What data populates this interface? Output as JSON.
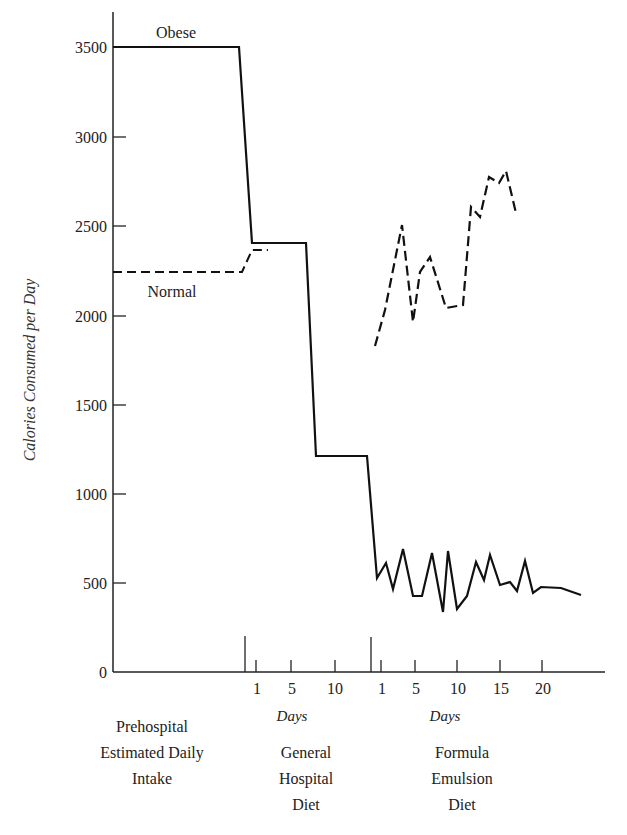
{
  "chart_data": {
    "type": "line",
    "title": "",
    "ylabel": "Calories Consumed per Day",
    "xlabel": "",
    "ylim": [
      0,
      3700
    ],
    "yticks": [
      0,
      500,
      1000,
      1500,
      2000,
      2500,
      3000,
      3500
    ],
    "grid": false,
    "phases": [
      {
        "name": "prehospital",
        "label_lines": [
          "Prehospital",
          "Estimated Daily",
          "Intake"
        ],
        "x_label": ""
      },
      {
        "name": "general-hospital",
        "label_lines": [
          "General",
          "Hospital",
          "Diet"
        ],
        "x_label": "Days",
        "day_ticks": [
          1,
          5,
          10
        ]
      },
      {
        "name": "formula-emulsion",
        "label_lines": [
          "Formula",
          "Emulsion",
          "Diet"
        ],
        "x_label": "Days",
        "day_ticks": [
          1,
          5,
          10,
          15,
          20
        ]
      }
    ],
    "series": [
      {
        "name": "Obese",
        "style": "solid",
        "segments": {
          "prehospital": 3500,
          "general_hospital": [
            {
              "days": "1-6",
              "value": 2400
            },
            {
              "days": "7-13",
              "value": 1200
            }
          ],
          "formula_emulsion": {
            "days": [
              0,
              1,
              2,
              3,
              4,
              5,
              6,
              7,
              8,
              9,
              10,
              11,
              12,
              13,
              14,
              15,
              16,
              17,
              18,
              19,
              20,
              22,
              24
            ],
            "values": [
              530,
              615,
              465,
              690,
              425,
              425,
              665,
              335,
              675,
              355,
              430,
              615,
              510,
              655,
              500,
              515,
              465,
              625,
              450,
              490,
              475,
              465,
              430
            ]
          }
        }
      },
      {
        "name": "Normal",
        "style": "dashed",
        "segments": {
          "prehospital": 2230,
          "general_hospital": [
            {
              "days": "1-2",
              "value": 2360
            }
          ],
          "formula_emulsion": {
            "days": [
              0,
              1,
              3,
              4,
              5,
              6,
              8,
              10,
              11,
              12,
              13,
              14,
              15,
              16
            ],
            "values": [
              1830,
              2030,
              2510,
              1965,
              2250,
              2335,
              2045,
              2060,
              2615,
              2555,
              2780,
              2745,
              2815,
              2580
            ]
          }
        }
      }
    ]
  },
  "labels": {
    "ylabel": "Calories Consumed per Day",
    "obese": "Obese",
    "normal": "Normal",
    "days1": "Days",
    "days2": "Days",
    "phase1": [
      "Prehospital",
      "Estimated Daily",
      "Intake"
    ],
    "phase2": [
      "General",
      "Hospital",
      "Diet"
    ],
    "phase3": [
      "Formula",
      "Emulsion",
      "Diet"
    ],
    "yticks": [
      "0",
      "500",
      "1000",
      "1500",
      "2000",
      "2500",
      "3000",
      "3500"
    ],
    "hospital_days": [
      "1",
      "5",
      "10"
    ],
    "formula_days": [
      "1",
      "5",
      "10",
      "15",
      "20"
    ]
  },
  "geometry": {
    "obese_path": [
      [
        113,
        47
      ],
      [
        239,
        47
      ],
      [
        252,
        243
      ],
      [
        306,
        243
      ],
      [
        316,
        456
      ],
      [
        367,
        456
      ],
      [
        377,
        578
      ],
      [
        386,
        563
      ],
      [
        393,
        589
      ],
      [
        403,
        549
      ],
      [
        413,
        596
      ],
      [
        422,
        596
      ],
      [
        432,
        553
      ],
      [
        443,
        612
      ],
      [
        448,
        551
      ],
      [
        457,
        609
      ],
      [
        467,
        596
      ],
      [
        476,
        562
      ],
      [
        484,
        580
      ],
      [
        490,
        555
      ],
      [
        500,
        585
      ],
      [
        510,
        582
      ],
      [
        517,
        591
      ],
      [
        525,
        561
      ],
      [
        533,
        593
      ],
      [
        541,
        587
      ],
      [
        561,
        588
      ],
      [
        581,
        595
      ]
    ],
    "normal_path_pre": [
      [
        113,
        272
      ],
      [
        242,
        272
      ],
      [
        252,
        250
      ],
      [
        268,
        250
      ]
    ],
    "normal_path_formula": [
      [
        375,
        346
      ],
      [
        385,
        310
      ],
      [
        402,
        225
      ],
      [
        413,
        322
      ],
      [
        420,
        272
      ],
      [
        430,
        257
      ],
      [
        446,
        308
      ],
      [
        463,
        305
      ],
      [
        471,
        207
      ],
      [
        480,
        217
      ],
      [
        489,
        177
      ],
      [
        499,
        183
      ],
      [
        506,
        171
      ],
      [
        516,
        213
      ]
    ]
  }
}
